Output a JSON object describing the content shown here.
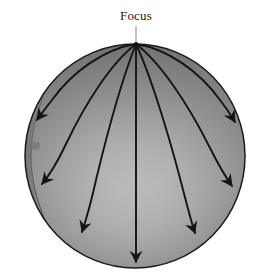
{
  "figure": {
    "title": "Focus",
    "kind": "geodesic-flow-on-sphere-diagram",
    "background_color": "#ffffff"
  },
  "labels": {
    "focus": "Focus"
  },
  "sphere": {
    "center_x": 135,
    "center_y": 156,
    "radius_x": 110,
    "radius_y": 112,
    "highlight_color": "#d2d2d2",
    "midtone_color": "#a6a6a6",
    "shadow_color": "#7a7a7a",
    "rim_color": "#5d5d5d",
    "outline_color": "#1b1b1b",
    "highlight_center_x": 135,
    "highlight_center_y": 152
  },
  "leader_line": {
    "from_x": 136,
    "from_y": 25,
    "to_x": 136,
    "to_y": 44,
    "color": "#8c8c8c"
  },
  "focus_point": {
    "x": 136,
    "y": 44
  },
  "curves": [
    {
      "name": "geodesic-far-left",
      "path": "M136,44 C 104,49 72,72 52,100 C 44,110 40,116 37,120",
      "arrow_tip_x": 37,
      "arrow_tip_y": 120,
      "arrow_angle": 215
    },
    {
      "name": "geodesic-mid-left",
      "path": "M136,44 C 112,62 86,102 66,144 C 56,165 48,177 42,184",
      "arrow_tip_x": 42,
      "arrow_tip_y": 184,
      "arrow_angle": 228
    },
    {
      "name": "geodesic-inner-left",
      "path": "M136,44 C 124,74 108,130 96,180 C 90,207 85,223 82,232",
      "arrow_tip_x": 82,
      "arrow_tip_y": 232,
      "arrow_angle": 252
    },
    {
      "name": "geodesic-center",
      "path": "M136,44 L136,262",
      "arrow_tip_x": 136,
      "arrow_tip_y": 264,
      "arrow_angle": 270
    },
    {
      "name": "geodesic-inner-right",
      "path": "M136,44 C 150,74 168,132 181,182 C 188,209 192,225 195,233",
      "arrow_tip_x": 195,
      "arrow_tip_y": 233,
      "arrow_angle": 288
    },
    {
      "name": "geodesic-mid-right",
      "path": "M136,44 C 160,62 188,104 209,146 C 219,166 227,179 232,186",
      "arrow_tip_x": 232,
      "arrow_tip_y": 186,
      "arrow_angle": 312
    },
    {
      "name": "geodesic-far-right",
      "path": "M136,44 C 168,49 200,72 220,100 C 228,110 232,117 235,122",
      "arrow_tip_x": 235,
      "arrow_tip_y": 122,
      "arrow_angle": 325
    }
  ],
  "colors": {
    "curve_stroke": "#141414",
    "arrow_fill": "#141414",
    "label_text": "#1a1a1a",
    "leader": "#8c8c8c"
  },
  "counts": {
    "geodesics": 7,
    "arrowheads": 7
  }
}
